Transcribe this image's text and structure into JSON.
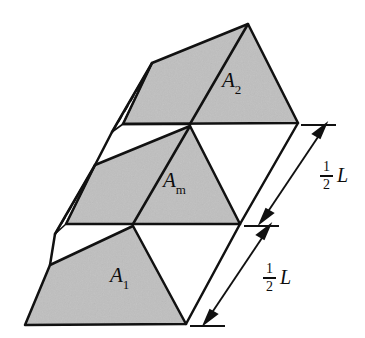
{
  "figure": {
    "background_color": "#ffffff",
    "shade_color": "#bfbfbf",
    "line_color": "#111111",
    "labels": {
      "area_top": {
        "symbol": "A",
        "subscript": "2",
        "full": "A2"
      },
      "area_middle": {
        "symbol": "A",
        "subscript": "m",
        "full": "Am"
      },
      "area_bottom": {
        "symbol": "A",
        "subscript": "1",
        "full": "A1"
      }
    },
    "dimensions": [
      {
        "name": "upper-half-length",
        "numerator": "1",
        "denominator": "2",
        "variable": "L"
      },
      {
        "name": "lower-half-length",
        "numerator": "1",
        "denominator": "2",
        "variable": "L"
      }
    ]
  }
}
